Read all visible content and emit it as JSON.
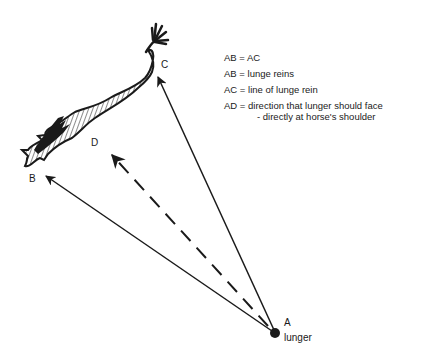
{
  "diagram": {
    "points": {
      "A": {
        "label": "A",
        "sublabel": "lunger"
      },
      "B": {
        "label": "B"
      },
      "C": {
        "label": "C"
      },
      "D": {
        "label": "D"
      }
    },
    "legend": [
      {
        "key": "AB",
        "eq": "=",
        "text": "AC"
      },
      {
        "key": "AB",
        "eq": "=",
        "text": "lunge reins"
      },
      {
        "key": "AC",
        "eq": "=",
        "text": "line of lunge rein"
      },
      {
        "key": "AD",
        "eq": "=",
        "text": "direction that lunger should face",
        "continuation": "- directly at horse's shoulder"
      }
    ],
    "lines": [
      {
        "from": "A",
        "to": "B",
        "style": "solid",
        "arrow": true
      },
      {
        "from": "A",
        "to": "C",
        "style": "solid",
        "arrow": true
      },
      {
        "from": "A",
        "to": "D",
        "style": "dashed",
        "arrow": true
      }
    ],
    "colors": {
      "ink": "#1a1a1a",
      "background": "#ffffff"
    }
  }
}
